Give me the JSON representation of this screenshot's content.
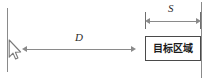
{
  "figure": {
    "name": "target-acquisition-diagram",
    "background_color": "#ffffff",
    "line_color": "#8a8a8a",
    "box_border_color": "#4a4a4a",
    "text_color": "#1c1c1c"
  },
  "cursor": {
    "icon": "mouse-pointer-icon",
    "fill_color": "#ffffff",
    "stroke_color": "#7a7a7a"
  },
  "boundaries": {
    "left_line_label": "",
    "right_line_label": ""
  },
  "dimensions": [
    {
      "id": "distance",
      "label": "D",
      "icon": "double-headed-arrow-icon",
      "description": "distance from cursor to target"
    },
    {
      "id": "size",
      "label": "S",
      "icon": "double-headed-arrow-icon",
      "description": "width of target region"
    }
  ],
  "target": {
    "label": "目标区域",
    "border_color": "#4a4a4a"
  }
}
